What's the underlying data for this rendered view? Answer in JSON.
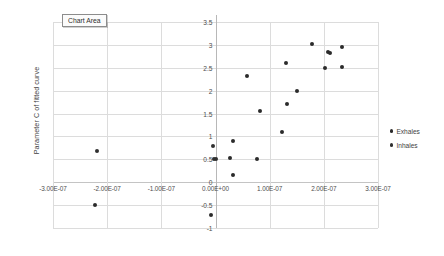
{
  "tooltip": {
    "label": "Chart Area"
  },
  "legend": {
    "position": "right",
    "items": [
      {
        "label": "Exhales",
        "color": "#2b2b2b",
        "marker": "circle"
      },
      {
        "label": "Inhales",
        "color": "#303030",
        "marker": "circle"
      }
    ]
  },
  "chart_data": {
    "type": "scatter",
    "title": "",
    "subtitle": "",
    "xlabel": "",
    "ylabel": "Parameter C of fitted curve",
    "xlim": [
      -3e-07,
      3e-07
    ],
    "ylim": [
      -1,
      3.5
    ],
    "grid": true,
    "xticks": [
      -3e-07,
      -2e-07,
      -1e-07,
      0,
      1e-07,
      2e-07,
      3e-07
    ],
    "xtick_labels": [
      "-3.00E-07",
      "-2.00E-07",
      "-1.00E-07",
      "0.00E+00",
      "1.00E-07",
      "2.00E-07",
      "3.00E-07"
    ],
    "yticks": [
      -1,
      -0.5,
      0,
      0.5,
      1,
      1.5,
      2,
      2.5,
      3,
      3.5
    ],
    "ytick_labels": [
      "-1",
      "-0.5",
      "0",
      "0.5",
      "1",
      "1.5",
      "2",
      "2.5",
      "3",
      "3.5"
    ],
    "legend_position": "right",
    "series": [
      {
        "name": "Exhales",
        "color": "#2b2b2b",
        "points": [
          {
            "x": -2.22e-07,
            "y": -0.5
          },
          {
            "x": -9e-09,
            "y": -0.71
          },
          {
            "x": 3.3e-08,
            "y": 0.15
          },
          {
            "x": 2.6e-08,
            "y": 0.52
          },
          {
            "x": 3.3e-08,
            "y": 0.9
          },
          {
            "x": 7.6e-08,
            "y": 0.51
          },
          {
            "x": 5.8e-08,
            "y": 2.31
          },
          {
            "x": 8.2e-08,
            "y": 1.56
          },
          {
            "x": 1.23e-07,
            "y": 1.1
          },
          {
            "x": 1.32e-07,
            "y": 1.7
          },
          {
            "x": 1.3e-07,
            "y": 2.6
          },
          {
            "x": 1.5e-07,
            "y": 1.99
          },
          {
            "x": 1.78e-07,
            "y": 3.02
          },
          {
            "x": 2.02e-07,
            "y": 2.49
          },
          {
            "x": 2.08e-07,
            "y": 2.84
          },
          {
            "x": 2.12e-07,
            "y": 2.83
          },
          {
            "x": 2.34e-07,
            "y": 2.95
          },
          {
            "x": 2.34e-07,
            "y": 2.52
          }
        ]
      },
      {
        "name": "Inhales",
        "color": "#303030",
        "points": [
          {
            "x": -2.19e-07,
            "y": 0.68
          },
          {
            "x": -4e-09,
            "y": 0.8
          },
          {
            "x": -2e-09,
            "y": 0.51
          },
          {
            "x": 1e-09,
            "y": 0.5
          }
        ]
      }
    ]
  }
}
